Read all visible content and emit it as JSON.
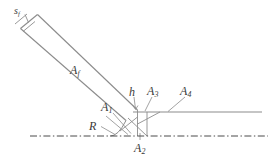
{
  "figure": {
    "background_color": "#ffffff",
    "line_color": "#8c8c8c",
    "text_color": "#3a3a3a",
    "axis_line_color": "#4a4a4a"
  },
  "labels": {
    "s_f": {
      "base": "s",
      "sub": "f"
    },
    "A_f": {
      "base": "A",
      "sub": "f"
    },
    "A_1": {
      "base": "A",
      "sub": "1"
    },
    "A_2": {
      "base": "A",
      "sub": "2"
    },
    "A_3": {
      "base": "A",
      "sub": "3"
    },
    "A_4": {
      "base": "A",
      "sub": "4"
    },
    "h": {
      "base": "h",
      "sub": ""
    },
    "R": {
      "base": "R",
      "sub": ""
    }
  },
  "geometry": {
    "axis_of_symmetry": {
      "y": 136,
      "x_start": 30,
      "x_end": 268,
      "style": "dash-dot"
    },
    "bar": {
      "description": "inclined flow channel",
      "top_left_outer": [
        20,
        28
      ],
      "top_left_inner": [
        38,
        14
      ],
      "end_right": [
        128,
        118
      ]
    },
    "horizontal_wall": {
      "y": 112,
      "x_start": 133,
      "x_end": 262
    }
  }
}
